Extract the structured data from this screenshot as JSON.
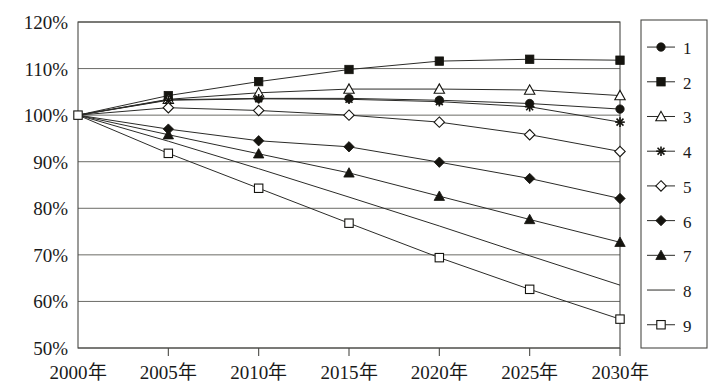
{
  "chart_data": {
    "type": "line",
    "title": "",
    "xlabel": "",
    "ylabel": "",
    "x": [
      "2000年",
      "2005年",
      "2010年",
      "2015年",
      "2020年",
      "2025年",
      "2030年"
    ],
    "x_tick_labels": [
      "2000年",
      "2005年",
      "2010年",
      "2015年",
      "2020年",
      "2025年",
      "2030年"
    ],
    "y_tick_labels": [
      "120%",
      "110%",
      "100%",
      "90%",
      "80%",
      "70%",
      "60%",
      "50%"
    ],
    "y_tick_values": [
      120,
      110,
      100,
      90,
      80,
      70,
      60,
      50
    ],
    "ylim": [
      50,
      120
    ],
    "grid": "horizontal",
    "legend_position": "right",
    "series": [
      {
        "name": "1",
        "marker": "filled-circle",
        "values": [
          100,
          103.3,
          103.6,
          103.6,
          103.2,
          102.5,
          101.3
        ]
      },
      {
        "name": "2",
        "marker": "filled-square",
        "values": [
          100,
          104.2,
          107.2,
          109.8,
          111.6,
          112.0,
          111.8
        ]
      },
      {
        "name": "3",
        "marker": "open-triangle",
        "values": [
          100,
          103.4,
          104.8,
          105.6,
          105.6,
          105.4,
          104.2
        ]
      },
      {
        "name": "4",
        "marker": "asterisk",
        "values": [
          100,
          103.2,
          103.5,
          103.4,
          102.9,
          101.8,
          98.5
        ]
      },
      {
        "name": "5",
        "marker": "open-diamond",
        "values": [
          100,
          101.6,
          101.0,
          100.0,
          98.5,
          95.8,
          92.2
        ]
      },
      {
        "name": "6",
        "marker": "filled-diamond",
        "values": [
          100,
          97.0,
          94.5,
          93.2,
          89.9,
          86.4,
          82.1
        ]
      },
      {
        "name": "7",
        "marker": "filled-triangle",
        "values": [
          100,
          95.8,
          91.7,
          87.6,
          82.6,
          77.6,
          72.7
        ]
      },
      {
        "name": "8",
        "marker": "none",
        "values": [
          100,
          94.4,
          88.5,
          82.4,
          76.2,
          69.8,
          63.5
        ]
      },
      {
        "name": "9",
        "marker": "open-square",
        "values": [
          100,
          91.8,
          84.3,
          76.8,
          69.4,
          62.6,
          56.2
        ]
      }
    ],
    "legend_entries": [
      {
        "label": "1",
        "marker": "filled-circle"
      },
      {
        "label": "2",
        "marker": "filled-square"
      },
      {
        "label": "3",
        "marker": "open-triangle"
      },
      {
        "label": "4",
        "marker": "asterisk"
      },
      {
        "label": "5",
        "marker": "open-diamond"
      },
      {
        "label": "6",
        "marker": "filled-diamond"
      },
      {
        "label": "7",
        "marker": "filled-triangle"
      },
      {
        "label": "8",
        "marker": "none"
      },
      {
        "label": "9",
        "marker": "open-square"
      }
    ],
    "colors": {
      "line": "#2b2b28",
      "marker": "#15140f",
      "grid": "#5a5a55",
      "frame": "#4a4a46",
      "background": "#ffffff"
    }
  }
}
